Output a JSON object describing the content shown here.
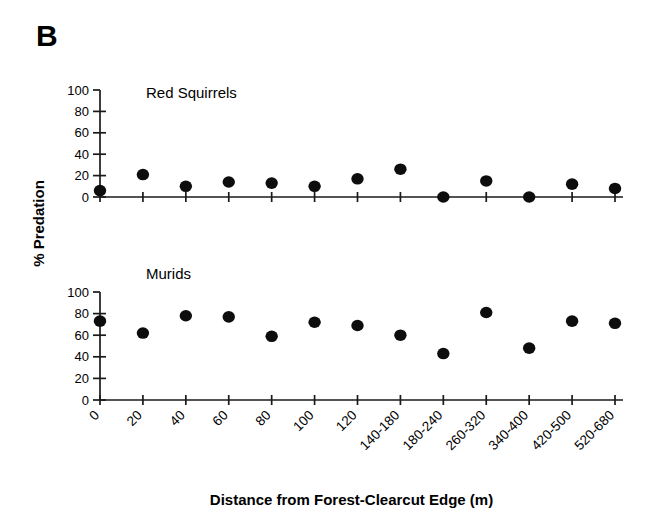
{
  "figure": {
    "panel_letter": "B",
    "x_axis_title": "Distance from Forest-Clearcut Edge (m)",
    "y_axis_title": "% Predation"
  },
  "chart_data": {
    "type": "scatter",
    "title": "B",
    "xlabel": "Distance from Forest-Clearcut Edge (m)",
    "ylabel": "% Predation",
    "grid": false,
    "legend": "none",
    "categories": [
      "0",
      "20",
      "40",
      "60",
      "80",
      "100",
      "120",
      "140-180",
      "180-240",
      "260-320",
      "340-400",
      "420-500",
      "520-680"
    ],
    "panels": [
      {
        "name": "Red Squirrels",
        "label": "Red Squirrels",
        "ylim": [
          0,
          100
        ],
        "yticks": [
          0,
          20,
          40,
          60,
          80,
          100
        ],
        "ytick_labels": [
          "0",
          "20",
          "40",
          "60",
          "80",
          "100"
        ],
        "values": [
          6,
          21,
          10,
          14,
          13,
          10,
          17,
          26,
          0,
          15,
          0,
          12,
          8
        ]
      },
      {
        "name": "Murids",
        "label": "Murids",
        "ylim": [
          0,
          100
        ],
        "yticks": [
          0,
          20,
          40,
          60,
          80,
          100
        ],
        "ytick_labels": [
          "0",
          "20",
          "40",
          "60",
          "80",
          "100"
        ],
        "values": [
          73,
          62,
          78,
          77,
          59,
          72,
          69,
          60,
          43,
          81,
          48,
          73,
          71
        ]
      }
    ]
  }
}
